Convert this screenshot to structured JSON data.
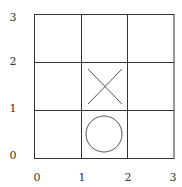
{
  "diagram": {
    "type": "tic-tac-toe-grid",
    "grid": {
      "cols": 3,
      "rows": 3,
      "x_range": [
        0,
        3
      ],
      "y_range": [
        0,
        3
      ],
      "line_color": "#333333"
    },
    "x_axis": {
      "ticks": [
        "0",
        "1",
        "2",
        "3"
      ]
    },
    "y_axis": {
      "ticks": [
        "0",
        "1",
        "2",
        "3"
      ]
    },
    "marks": [
      {
        "symbol": "X",
        "cell": [
          1,
          1
        ],
        "label": "X",
        "color": "#555555"
      },
      {
        "symbol": "O",
        "cell": [
          1,
          0
        ],
        "label": "O",
        "color": "#555555"
      }
    ]
  }
}
